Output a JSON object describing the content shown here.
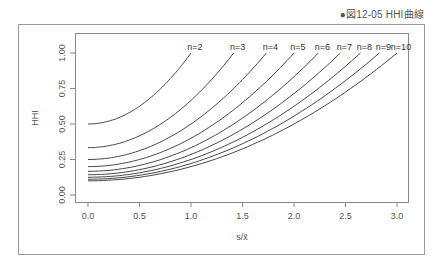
{
  "caption": "●図12-05 HHI曲線",
  "chart_data": {
    "type": "line",
    "title": "HHI曲線",
    "xlabel": "s/x̄",
    "ylabel": "HHI",
    "xlim": [
      0,
      3.0
    ],
    "ylim": [
      0,
      1.0
    ],
    "x_ticks": [
      "0.0",
      "0.5",
      "1.0",
      "1.5",
      "2.0",
      "2.5",
      "3.0"
    ],
    "y_ticks": [
      "0.00",
      "0.25",
      "0.50",
      "0.75",
      "1.00"
    ],
    "grid": false,
    "formula": "HHI = (1 + (s/x̄)^2) / n, for s/x̄ from 0 to sqrt(n-1)",
    "series": [
      {
        "name": "n=2",
        "n": 2,
        "start": [
          0,
          0.5
        ],
        "end": [
          1.0,
          1.0
        ]
      },
      {
        "name": "n=3",
        "n": 3,
        "start": [
          0,
          0.333
        ],
        "end": [
          1.414,
          1.0
        ]
      },
      {
        "name": "n=4",
        "n": 4,
        "start": [
          0,
          0.25
        ],
        "end": [
          1.732,
          1.0
        ]
      },
      {
        "name": "n=5",
        "n": 5,
        "start": [
          0,
          0.2
        ],
        "end": [
          2.0,
          1.0
        ]
      },
      {
        "name": "n=6",
        "n": 6,
        "start": [
          0,
          0.167
        ],
        "end": [
          2.236,
          1.0
        ]
      },
      {
        "name": "n=7",
        "n": 7,
        "start": [
          0,
          0.143
        ],
        "end": [
          2.449,
          1.0
        ]
      },
      {
        "name": "n=8",
        "n": 8,
        "start": [
          0,
          0.125
        ],
        "end": [
          2.646,
          1.0
        ]
      },
      {
        "name": "n=9",
        "n": 9,
        "start": [
          0,
          0.111
        ],
        "end": [
          2.828,
          1.0
        ]
      },
      {
        "name": "n=10",
        "n": 10,
        "start": [
          0,
          0.1
        ],
        "end": [
          3.0,
          1.0
        ]
      }
    ]
  }
}
